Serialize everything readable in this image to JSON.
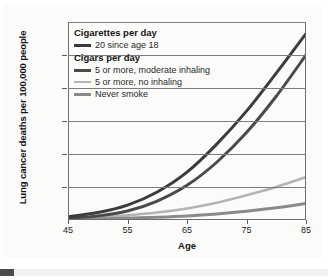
{
  "chart_data": {
    "type": "line",
    "title": "",
    "xlabel": "Age",
    "ylabel": "Lung cancer deaths per 100,000 people",
    "xlim": [
      45,
      85
    ],
    "ylim": [
      0,
      1200
    ],
    "xticks": [
      "45",
      "55",
      "65",
      "75",
      "85"
    ],
    "xtick_values": [
      45,
      55,
      65,
      75,
      85
    ],
    "yticks": [
      "0",
      "200",
      "400",
      "600",
      "800",
      "1,000",
      "1,200"
    ],
    "ytick_values": [
      0,
      200,
      400,
      600,
      800,
      1000,
      1200
    ],
    "grid": "horizontal",
    "legend_position": "upper-left-inside",
    "x": [
      45,
      50,
      55,
      60,
      65,
      70,
      75,
      80,
      85
    ],
    "series": [
      {
        "name": "20 since age 18",
        "group": "Cigarettes per day",
        "color": "#3c3c3c",
        "values": [
          20,
          45,
          90,
          170,
          290,
          460,
          660,
          890,
          1130
        ]
      },
      {
        "name": "5 or more, moderate inhaling",
        "group": "Cigars per day",
        "color": "#4a4a4a",
        "values": [
          10,
          25,
          55,
          115,
          210,
          350,
          530,
          750,
          1000
        ]
      },
      {
        "name": "5 or more, no inhaling",
        "group": "Cigars per day",
        "color": "#b4b4b4",
        "values": [
          8,
          16,
          28,
          45,
          70,
          105,
          150,
          200,
          260
        ]
      },
      {
        "name": "Never smoke",
        "group": "Cigars per day",
        "color": "#8a8a8a",
        "values": [
          4,
          7,
          11,
          17,
          25,
          37,
          53,
          74,
          100
        ]
      }
    ]
  },
  "legend": {
    "groups": [
      {
        "heading": "Cigarettes per day",
        "entries": [
          {
            "label": "20 since age 18",
            "color": "#3c3c3c",
            "weight": "thick"
          }
        ]
      },
      {
        "heading": "Cigars per day",
        "entries": [
          {
            "label": "5 or more, moderate inhaling",
            "color": "#4a4a4a",
            "weight": "thick"
          },
          {
            "label": "5 or more, no inhaling",
            "color": "#b4b4b4",
            "weight": "thin"
          },
          {
            "label": "Never smoke",
            "color": "#8a8a8a",
            "weight": "thick"
          }
        ]
      }
    ]
  }
}
